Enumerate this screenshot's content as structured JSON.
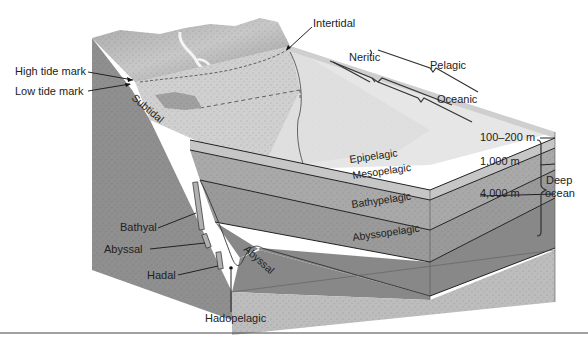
{
  "diagram": {
    "left_labels": {
      "high_tide": "High tide mark",
      "low_tide": "Low tide mark",
      "subtidal": "Subtidal",
      "bathyal": "Bathyal",
      "abyssal": "Abyssal",
      "hadal": "Hadal",
      "hadopelagic": "Hadopelagic",
      "abyssal_floor": "Abyssal"
    },
    "top_labels": {
      "intertidal": "Intertidal",
      "neritic": "Neritic",
      "pelagic": "Pelagic",
      "oceanic": "Oceanic"
    },
    "layers": {
      "epipelagic": "Epipelagic",
      "mesopelagic": "Mesopelagic",
      "bathypelagic": "Bathypelagic",
      "abyssopelagic": "Abyssopelagic"
    },
    "depths": {
      "d1": "100–200 m",
      "d2": "1,000 m",
      "d3": "4,000 m"
    },
    "deep_ocean": {
      "line1": "Deep",
      "line2": "ocean"
    },
    "colors": {
      "land": "#9a9a9a",
      "surface": "#d4d4d4",
      "epipelagic": "#c9c9c9",
      "mesopelagic": "#ababab",
      "bathypelagic": "#9c9c9c",
      "abyssopelagic": "#8a8a8a",
      "sediment": "#bdbdbd",
      "cliff": "#8c8c8c"
    }
  }
}
